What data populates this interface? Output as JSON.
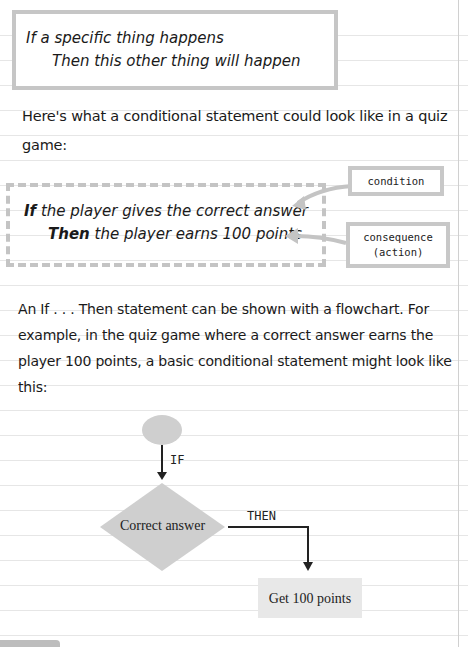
{
  "intro_box": {
    "line1_keyword": "If",
    "line1_rest": " a specific thing happens",
    "line2": "Then this other thing will happen"
  },
  "paragraph1": "Here's what a conditional statement could look like in a quiz game:",
  "example_box": {
    "line1_keyword": "If",
    "line1_rest": " the player gives the correct answer",
    "line2_keyword": "Then",
    "line2_rest": " the player earns 100 points"
  },
  "callouts": {
    "condition": "condition",
    "consequence_line1": "consequence",
    "consequence_line2": "(action)"
  },
  "paragraph2": "An If . . . Then statement can be shown with a flowchart. For example, in the quiz game where a correct answer earns the player 100 points, a basic conditional statement might look like this:",
  "flowchart": {
    "if_label": "IF",
    "decision": "Correct answer",
    "then_label": "THEN",
    "action": "Get 100 points",
    "shape_color": "#cfcfcf",
    "action_color": "#e8e8e8"
  }
}
